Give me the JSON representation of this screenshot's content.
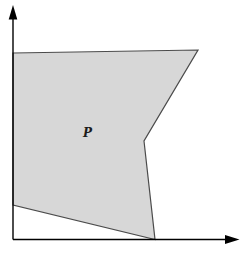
{
  "figure": {
    "background": "#ffffff",
    "label": {
      "text": "P",
      "x": 83,
      "y": 137,
      "color": "#1c1c1c",
      "font_size": 12
    },
    "polygon": {
      "name": "P",
      "vertices": [
        [
          13,
          53
        ],
        [
          198,
          50
        ],
        [
          144,
          141
        ],
        [
          155,
          239.5
        ],
        [
          13,
          205
        ]
      ],
      "points": "13,53 198,50 144,141 155,239.5 13,205",
      "fill": "#d7d7d7",
      "stroke": "#4b4b4b",
      "stroke_width": 1.2
    },
    "axes": {
      "color": "#000000",
      "stroke_width": 1.4,
      "y_axis_d": "M 13 16 L 13 239.5",
      "x_axis_d": "M 13 239.5 L 227 239.5",
      "y_arrow_points": "13,5 8.7,19.5 17.3,19.5",
      "x_arrow_points": "239.5,239.5 225,235.1 225,243.9"
    }
  }
}
